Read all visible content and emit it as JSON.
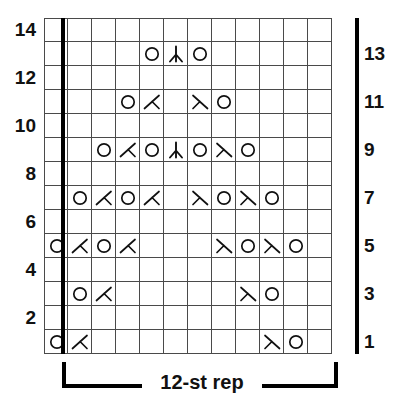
{
  "chart": {
    "columns": 12,
    "rows": 14,
    "grid_line_color": "#4a4a4a",
    "repeat_border_color": "#000000",
    "repeat_label": "12-st rep",
    "left_row_numbers": [
      "14",
      "12",
      "10",
      "8",
      "6",
      "4",
      "2"
    ],
    "right_row_numbers": [
      "13",
      "11",
      "9",
      "7",
      "5",
      "3",
      "1"
    ],
    "symbol_legend": {
      "yo": "yarn-over-circle",
      "dec_left": "left-leaning-decrease",
      "dec_right": "right-leaning-decrease",
      "cdd": "centered-double-decrease",
      "blank": "empty-knit-cell"
    },
    "rows_data": [
      {
        "row": 14,
        "side": "left",
        "cells": [
          "blank",
          "blank",
          "blank",
          "blank",
          "blank",
          "blank",
          "blank",
          "blank",
          "blank",
          "blank",
          "blank",
          "blank"
        ]
      },
      {
        "row": 13,
        "side": "right",
        "cells": [
          "blank",
          "blank",
          "blank",
          "blank",
          "yo",
          "cdd",
          "yo",
          "blank",
          "blank",
          "blank",
          "blank",
          "blank"
        ]
      },
      {
        "row": 12,
        "side": "left",
        "cells": [
          "blank",
          "blank",
          "blank",
          "blank",
          "blank",
          "blank",
          "blank",
          "blank",
          "blank",
          "blank",
          "blank",
          "blank"
        ]
      },
      {
        "row": 11,
        "side": "right",
        "cells": [
          "blank",
          "blank",
          "blank",
          "yo",
          "dec_left",
          "blank",
          "dec_right",
          "yo",
          "blank",
          "blank",
          "blank",
          "blank"
        ]
      },
      {
        "row": 10,
        "side": "left",
        "cells": [
          "blank",
          "blank",
          "blank",
          "blank",
          "blank",
          "blank",
          "blank",
          "blank",
          "blank",
          "blank",
          "blank",
          "blank"
        ]
      },
      {
        "row": 9,
        "side": "right",
        "cells": [
          "blank",
          "blank",
          "yo",
          "dec_left",
          "yo",
          "cdd",
          "yo",
          "dec_right",
          "yo",
          "blank",
          "blank",
          "blank"
        ]
      },
      {
        "row": 8,
        "side": "left",
        "cells": [
          "blank",
          "blank",
          "blank",
          "blank",
          "blank",
          "blank",
          "blank",
          "blank",
          "blank",
          "blank",
          "blank",
          "blank"
        ]
      },
      {
        "row": 7,
        "side": "right",
        "cells": [
          "blank",
          "yo",
          "dec_left",
          "yo",
          "dec_left",
          "blank",
          "dec_right",
          "yo",
          "dec_right",
          "yo",
          "blank",
          "blank"
        ]
      },
      {
        "row": 6,
        "side": "left",
        "cells": [
          "blank",
          "blank",
          "blank",
          "blank",
          "blank",
          "blank",
          "blank",
          "blank",
          "blank",
          "blank",
          "blank",
          "blank"
        ]
      },
      {
        "row": 5,
        "side": "right",
        "cells": [
          "yo",
          "dec_left",
          "yo",
          "dec_left",
          "blank",
          "blank",
          "blank",
          "dec_right",
          "yo",
          "dec_right",
          "yo",
          "blank"
        ]
      },
      {
        "row": 4,
        "side": "left",
        "cells": [
          "blank",
          "blank",
          "blank",
          "blank",
          "blank",
          "blank",
          "blank",
          "blank",
          "blank",
          "blank",
          "blank",
          "blank"
        ]
      },
      {
        "row": 3,
        "side": "right",
        "cells": [
          "blank",
          "yo",
          "dec_left",
          "blank",
          "blank",
          "blank",
          "blank",
          "blank",
          "dec_right",
          "yo",
          "blank",
          "blank"
        ]
      },
      {
        "row": 2,
        "side": "left",
        "cells": [
          "blank",
          "blank",
          "blank",
          "blank",
          "blank",
          "blank",
          "blank",
          "blank",
          "blank",
          "blank",
          "blank",
          "blank"
        ]
      },
      {
        "row": 1,
        "side": "right",
        "cells": [
          "yo",
          "dec_left",
          "blank",
          "blank",
          "blank",
          "blank",
          "blank",
          "blank",
          "blank",
          "dec_right",
          "yo",
          "blank"
        ]
      }
    ]
  }
}
